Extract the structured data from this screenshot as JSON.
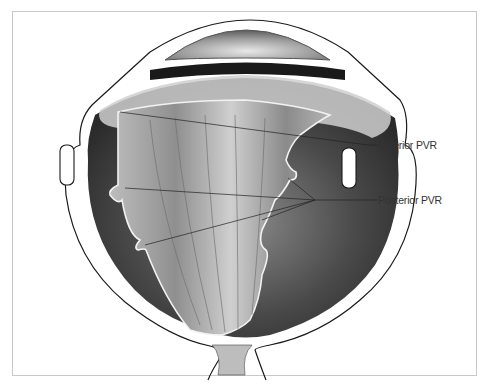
{
  "figure": {
    "labels": [
      {
        "id": "anterior",
        "text": "Anterior PVR"
      },
      {
        "id": "posterior",
        "text": "Posterior PVR"
      }
    ]
  },
  "colors": {
    "background": "#ffffff",
    "frame_border": "#c9c9c9",
    "outline": "#1a1a1a",
    "choroid_dark": "#3a3a3a",
    "retina_gray": "#9a9a9a",
    "leader_line": "#222222",
    "label_text": "#333333"
  }
}
